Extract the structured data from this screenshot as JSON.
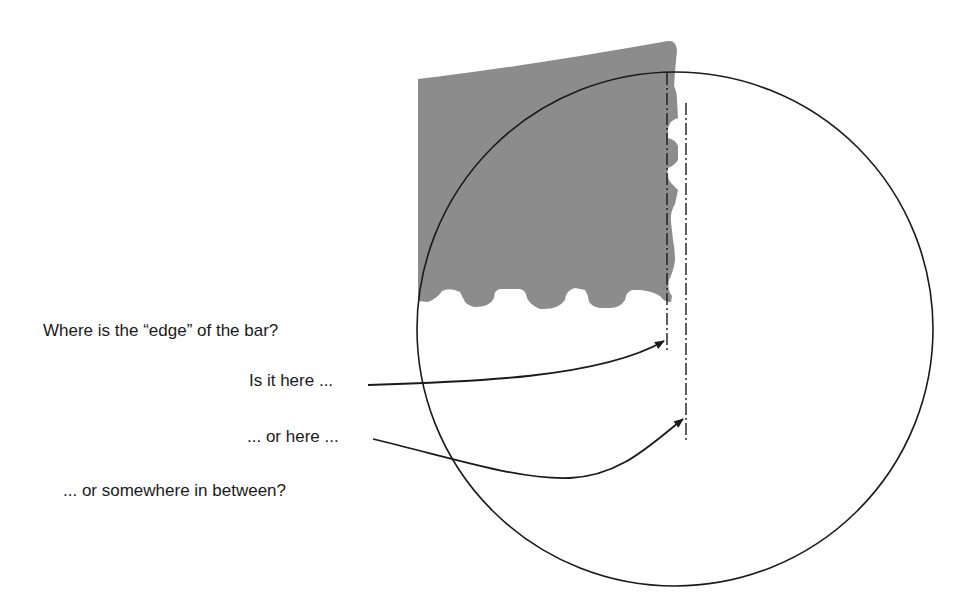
{
  "figure": {
    "question": "Where is the “edge” of the bar?",
    "option_1": "Is it here ...",
    "option_2": "... or here ...",
    "option_3": "... or somewhere in between?"
  },
  "elements": {
    "bar": {
      "description": "grey printed bar with ragged right and bottom edge",
      "color": "#8c8c8c"
    },
    "magnifier": {
      "description": "circular magnified view outline",
      "color": "#1a1a1a"
    },
    "edge_line_inner": {
      "style": "dash-dot",
      "meaning": "inner edge candidate"
    },
    "edge_line_outer": {
      "style": "dash-dot",
      "meaning": "outer edge candidate"
    }
  }
}
